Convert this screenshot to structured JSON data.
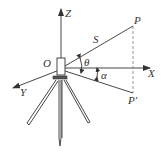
{
  "diagram": {
    "labels": {
      "z_axis": "Z",
      "x_axis": "X",
      "y_axis": "Y",
      "origin": "O",
      "point": "P",
      "projection": "P'",
      "slope_distance": "S",
      "vertical_angle": "θ",
      "horizontal_angle": "α"
    },
    "colors": {
      "line": "#333333",
      "dashed": "#777777",
      "background": "#ffffff"
    }
  }
}
